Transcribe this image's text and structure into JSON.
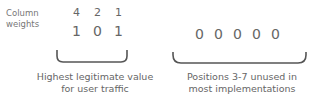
{
  "row_label": {
    "line1": "Column",
    "line2": "weights"
  },
  "weights": [
    "4",
    "2",
    "1"
  ],
  "used_bits": [
    "1",
    "0",
    "1"
  ],
  "unused_bits": [
    "0",
    "0",
    "0",
    "0",
    "0"
  ],
  "captions": {
    "left": {
      "line1": "Highest legitimate value",
      "line2": "for user traffic"
    },
    "right": {
      "line1": "Positions 3-7 unused in",
      "line2": "most implementations"
    }
  },
  "colors": {
    "text": "#666666",
    "bracket": "#555555"
  }
}
